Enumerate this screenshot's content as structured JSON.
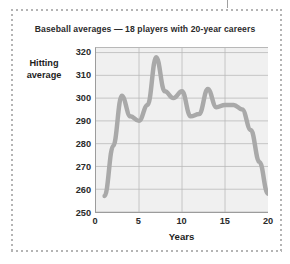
{
  "figure": {
    "title": "Baseball averages — 18 players with 20-year careers",
    "frame_color": "#b4b4b4",
    "background": "#ffffff"
  },
  "chart_data": {
    "type": "line",
    "title": "Baseball averages — 18 players with 20-year careers",
    "xlabel": "Years",
    "ylabel": "Hitting average",
    "ylabel_lines": [
      "Hitting",
      "average"
    ],
    "xlim": [
      0,
      20
    ],
    "ylim": [
      250,
      322
    ],
    "xticks": [
      0,
      5,
      10,
      15,
      20
    ],
    "yticks": [
      250,
      260,
      270,
      280,
      290,
      300,
      310,
      320
    ],
    "grid": "horizontal-and-vertical",
    "grid_color": "#b9b9b9",
    "plot_background": "#f0f0f0",
    "legend": null,
    "line_color": "#a9a9a9",
    "line_width": 4.5,
    "series": [
      {
        "name": "Mean hitting average",
        "x": [
          1,
          2,
          3,
          4,
          5,
          6,
          7,
          8,
          9,
          10,
          11,
          12,
          13,
          14,
          15,
          16,
          17,
          18,
          19,
          20
        ],
        "values": [
          257,
          279,
          301,
          292,
          290,
          297,
          318,
          303,
          300,
          303,
          292,
          293,
          304,
          296,
          297,
          297,
          295,
          286,
          272,
          258
        ]
      }
    ],
    "annotations": []
  },
  "axis": {
    "y_tick_labels": [
      "320",
      "310",
      "300",
      "290",
      "280",
      "270",
      "260",
      "250"
    ],
    "x_tick_labels": [
      "0",
      "5",
      "10",
      "15",
      "20"
    ]
  }
}
